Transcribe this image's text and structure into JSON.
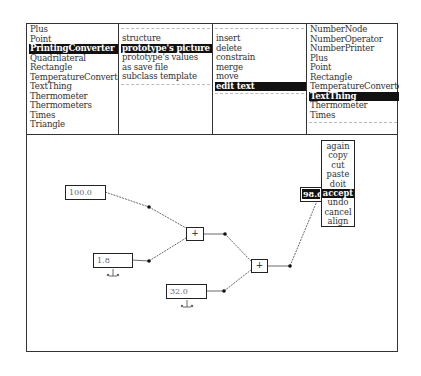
{
  "panels": {
    "classes": {
      "items": [
        "Plus",
        "Point",
        "PrintingConverter",
        "Quadrilateral",
        "Rectangle",
        "TemperatureConverter",
        "TextThing",
        "Thermometer",
        "Thermometers",
        "Times",
        "Triangle"
      ],
      "selected_index": 2
    },
    "class_commands": {
      "items": [
        "structure",
        "prototype's picture",
        "prototype's values",
        "as save file",
        "subclass template"
      ],
      "selected_index": 1
    },
    "picture_commands": {
      "items": [
        "insert",
        "delete",
        "constrain",
        "merge",
        "move",
        "edit text"
      ],
      "selected_index": 5
    },
    "part_classes": {
      "items": [
        "NumberNode",
        "NumberOperator",
        "NumberPrinter",
        "Plus",
        "Point",
        "Rectangle",
        "TemperatureConverter",
        "TextThing",
        "Thermometer",
        "Times"
      ],
      "selected_index": 7
    }
  },
  "canvas": {
    "inputs": [
      {
        "name": "celsius-input",
        "value": "100.0"
      },
      {
        "name": "scale-input",
        "value": "1.8"
      },
      {
        "name": "offset-input",
        "value": "32.0"
      }
    ],
    "operators": [
      {
        "name": "plus-operator-1",
        "symbol": "+"
      },
      {
        "name": "plus-operator-2",
        "symbol": "+"
      }
    ],
    "output": {
      "value": "98.6"
    },
    "popup_menu": {
      "items": [
        "again",
        "copy",
        "cut",
        "paste",
        "doit",
        "accept",
        "undo",
        "cancel",
        "align"
      ],
      "selected_index": 5
    }
  },
  "colors": {
    "ink": "#222222",
    "highlight": "#111111",
    "background": "#ffffff"
  }
}
